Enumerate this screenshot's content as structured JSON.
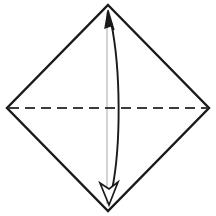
{
  "canvas": {
    "width": 216,
    "height": 216,
    "background": "#ffffff",
    "title": "Origami fold diagram: square base with vertical valley fold"
  },
  "palette": {
    "paper_edge": "#1a1a1a",
    "fold_crease_dashed": "#3a3a3a",
    "guide_line": "#c9c9c9",
    "arrow_stroke": "#1a1a1a",
    "arrow_head_solid_fill": "#1a1a1a",
    "arrow_head_hollow_fill": "#ffffff",
    "background": "#ffffff"
  },
  "shapes": {
    "paper_outline": {
      "label": "square-paper-rotated-45",
      "kind": "polygon",
      "stroke": "#1a1a1a",
      "stroke_width": 2.4,
      "fill": "none",
      "vertices": [
        {
          "name": "top",
          "x": 108,
          "y": 5
        },
        {
          "name": "right",
          "x": 209,
          "y": 108
        },
        {
          "name": "bottom",
          "x": 108,
          "y": 211
        },
        {
          "name": "left",
          "x": 7,
          "y": 108
        }
      ],
      "points": "108,5 209,108 108,211 7,108"
    },
    "horizontal_crease": {
      "label": "horizontal-dashed-fold-line",
      "kind": "line",
      "stroke": "#3a3a3a",
      "stroke_width": 2.0,
      "dash_array": "10 6",
      "x1": 9,
      "y1": 108,
      "x2": 207,
      "y2": 108
    },
    "vertical_guide": {
      "label": "vertical-guide-line",
      "kind": "line",
      "stroke": "#c9c9c9",
      "stroke_width": 1.6,
      "x1": 107,
      "y1": 12,
      "x2": 107,
      "y2": 204
    },
    "fold_arrow": {
      "label": "curved-double-headed-fold-arrow",
      "kind": "path",
      "stroke": "#1a1a1a",
      "stroke_width": 1.9,
      "fill": "none",
      "path": "M 111 22 C 121 70, 121 146, 112 190",
      "bulge_direction": "right",
      "max_bulge_x": 116,
      "heads": [
        {
          "name": "arrow-head-top-solid",
          "style": "solid",
          "direction": "up",
          "tip_x": 108,
          "tip_y": 10,
          "fill": "#1a1a1a",
          "stroke": "#1a1a1a",
          "points": "108,10 114,30 111,26 105,28"
        },
        {
          "name": "arrow-head-bottom-hollow",
          "style": "hollow",
          "direction": "down",
          "tip_x": 109,
          "tip_y": 205,
          "fill": "#ffffff",
          "stroke": "#1a1a1a",
          "points": "109,205 100,183 109,189 118,182"
        }
      ]
    }
  },
  "annotations": {
    "figure_caption": "",
    "step_number": "",
    "visible_text": []
  }
}
